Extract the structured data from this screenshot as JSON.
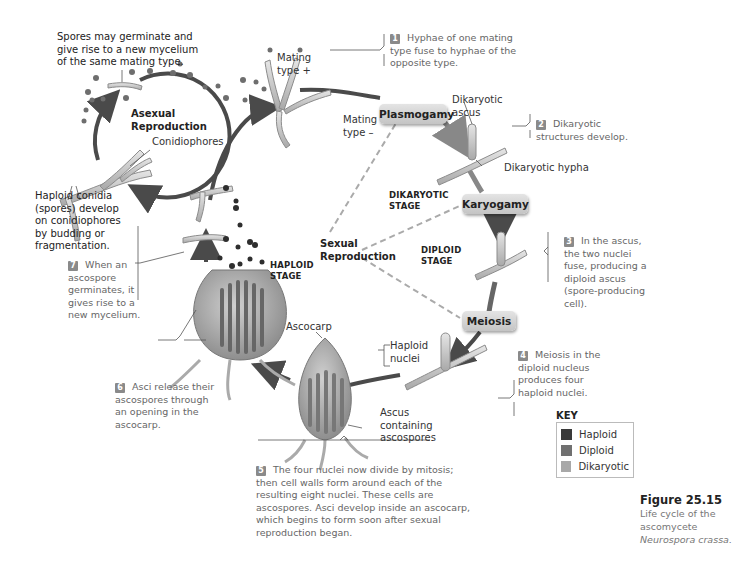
{
  "figure": {
    "number": "Figure 25.15",
    "caption_line1": "Life cycle of the",
    "caption_line2": "ascomycete",
    "caption_species": "Neurospora crassa."
  },
  "stages": {
    "plasmogamy": "Plasmogamy",
    "karyogamy": "Karyogamy",
    "meiosis": "Meiosis"
  },
  "phase_labels": {
    "asexual_line1": "Asexual",
    "asexual_line2": "Reproduction",
    "sexual_line1": "Sexual",
    "sexual_line2": "Reproduction",
    "dikaryotic_line1": "DIKARYOTIC",
    "dikaryotic_line2": "STAGE",
    "diploid_line1": "DIPLOID",
    "diploid_line2": "STAGE",
    "haploid_line1": "HAPLOID",
    "haploid_line2": "STAGE"
  },
  "structure_labels": {
    "mating_plus_1": "Mating",
    "mating_plus_2": "type +",
    "mating_minus_1": "Mating",
    "mating_minus_2": "type –",
    "dikaryotic_ascus_1": "Dikaryotic",
    "dikaryotic_ascus_2": "ascus",
    "dikaryotic_hypha": "Dikaryotic hypha",
    "conidiophores": "Conidiophores",
    "haploid_nuclei_1": "Haploid",
    "haploid_nuclei_2": "nuclei",
    "ascocarp": "Ascocarp",
    "ascus_1": "Ascus",
    "ascus_2": "containing",
    "ascus_3": "ascospores"
  },
  "notes": {
    "spores_1": "Spores may germinate and",
    "spores_2": "give rise to a new mycelium",
    "spores_3": "of the same mating type.",
    "conidia_1": "Haploid conidia",
    "conidia_2": "(spores) develop",
    "conidia_3": "on conidiophores",
    "conidia_4": "by budding or",
    "conidia_5": "fragmentation."
  },
  "steps": [
    {
      "num": "1",
      "lines": [
        "Hyphae of one mating",
        "type fuse to hyphae of the",
        "opposite type."
      ]
    },
    {
      "num": "2",
      "lines": [
        "Dikaryotic",
        "structures develop."
      ]
    },
    {
      "num": "3",
      "lines": [
        "In the ascus,",
        "the two nuclei",
        "fuse, producing a",
        "diploid ascus",
        "(spore-producing",
        "cell)."
      ]
    },
    {
      "num": "4",
      "lines": [
        "Meiosis in the",
        "diploid nucleus",
        "produces four",
        "haploid nuclei."
      ]
    },
    {
      "num": "5",
      "lines": [
        "The four nuclei now divide by mitosis;",
        "then cell walls form around each of the",
        "resulting eight nuclei. These cells are",
        "ascospores. Asci develop inside an ascocarp,",
        "which begins to form soon after sexual",
        "reproduction began."
      ]
    },
    {
      "num": "6",
      "lines": [
        "Asci release their",
        "ascospores through",
        "an opening in the",
        "ascocarp."
      ]
    },
    {
      "num": "7",
      "lines": [
        "When an",
        "ascospore",
        "germinates, it",
        "gives rise to a",
        "new mycelium."
      ]
    }
  ],
  "key": {
    "title": "KEY",
    "items": [
      {
        "label": "Haploid",
        "color": "#3a3a3a"
      },
      {
        "label": "Diploid",
        "color": "#707070"
      },
      {
        "label": "Dikaryotic",
        "color": "#a8a8a8"
      }
    ]
  },
  "colors": {
    "arrow": "#4a4a4a",
    "hypha": "#c9c9c9",
    "hypha_edge": "#8c8c8c",
    "spore": "#6e6e6e",
    "dashed": "#aaaaaa"
  }
}
